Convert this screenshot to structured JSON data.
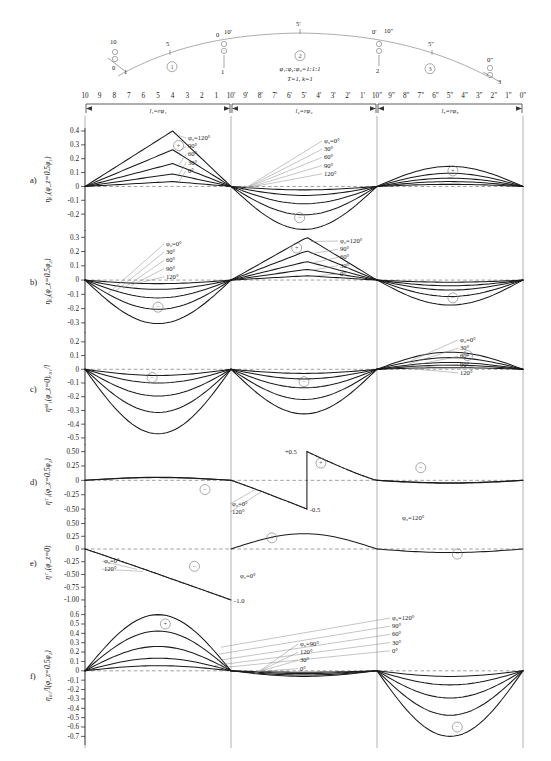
{
  "figure": {
    "title_params": {
      "ratio": "φ₁:φ₂:φ₃=1:1:1",
      "constants": "T=1,  k=1"
    },
    "cam_arc": {
      "sector_labels": [
        "①",
        "②",
        "③"
      ],
      "tick_marks": [
        "5",
        "10",
        "0",
        "10'",
        "5'",
        "0'",
        "10\"",
        "5\"",
        "0\""
      ],
      "node_numbers": [
        "0",
        "1",
        "2",
        "3"
      ]
    },
    "scale_rows": {
      "row1": [
        "10",
        "9",
        "8",
        "7",
        "6",
        "5",
        "4",
        "3",
        "2",
        "1"
      ],
      "row2": [
        "10'",
        "9'",
        "8'",
        "7'",
        "6'",
        "5'",
        "4'",
        "3'",
        "2'",
        "1'"
      ],
      "row3": [
        "10\"",
        "9\"",
        "8\"",
        "7\"",
        "6\"",
        "5\"",
        "4\"",
        "3\"",
        "2\"",
        "1\"",
        "0\""
      ],
      "span_labels": [
        "l₁=rφ₁",
        "l₂=rφ₂",
        "l₃=rφ₃"
      ]
    }
  },
  "panels": [
    {
      "letter": "a)",
      "ylabel": "ηᵦ₁(φ_z=0.5φ₁)",
      "yticks": [
        "0.4",
        "0.3",
        "0.2",
        "0.1",
        "0",
        "-0.1",
        "-0.2"
      ],
      "ymax": 0.4,
      "ymin": -0.3,
      "legend_seg1": [
        "φ₀=120°",
        "90°",
        "60°",
        "30°",
        "0°"
      ],
      "legend_seg2": [
        "φ₀=0°",
        "30°",
        "60°",
        "90°",
        "120°"
      ],
      "signs": [
        {
          "sym": "+",
          "seg": 1
        },
        {
          "sym": "−",
          "seg": 2
        },
        {
          "sym": "+",
          "seg": 3
        }
      ],
      "peaks_seg1": [
        0.4,
        0.265,
        0.165,
        0.09,
        0.035
      ],
      "peaks_seg2": [
        -0.31,
        -0.205,
        -0.125,
        -0.065,
        -0.025
      ],
      "peaks_seg3": [
        0.145,
        0.095,
        0.06,
        0.035,
        0.015
      ]
    },
    {
      "letter": "b)",
      "ylabel": "ηᵦ₂(φ_z=0.5φ₂)",
      "yticks": [
        "0.3",
        "0.2",
        "0.1",
        "0",
        "-0.1",
        "-0.2",
        "-0.3"
      ],
      "ymax": 0.33,
      "ymin": -0.35,
      "legend_seg1": [
        "φ₀=0°",
        "30°",
        "60°",
        "90°",
        "120°"
      ],
      "legend_seg2": [
        "φ₀=120°",
        "90°",
        "60°",
        "30°",
        "0°"
      ],
      "signs": [
        {
          "sym": "−",
          "seg": 1
        },
        {
          "sym": "+",
          "seg": 2
        },
        {
          "sym": "−",
          "seg": 3
        }
      ],
      "peaks_seg1": [
        -0.305,
        -0.205,
        -0.125,
        -0.065,
        -0.025
      ],
      "peaks_seg2": [
        0.3,
        0.205,
        0.13,
        0.075,
        0.03
      ],
      "peaks_seg3": [
        -0.175,
        -0.115,
        -0.07,
        -0.04,
        -0.015
      ]
    },
    {
      "letter": "c)",
      "ylabel": "ηᴹ₁(φ_z=0)ᵣ₀₁/l",
      "yticks": [
        "0.2",
        "0.1",
        "0",
        "-0.1",
        "-0.2",
        "-0.3",
        "-0.4",
        "-0.5"
      ],
      "ymax": 0.25,
      "ymin": -0.53,
      "legend_seg2": [
        "φ₀=0°",
        "30°",
        "60°",
        "90°",
        "120°"
      ],
      "signs": [
        {
          "sym": "−",
          "seg": 1
        },
        {
          "sym": "−",
          "seg": 2
        },
        {
          "sym": "+",
          "seg": 3
        }
      ],
      "peaks_seg1": [
        -0.47,
        -0.315,
        -0.195,
        -0.1,
        -0.045
      ],
      "peaks_seg2": [
        -0.325,
        -0.22,
        -0.135,
        -0.07,
        -0.03
      ],
      "peaks_seg3": [
        0.125,
        0.085,
        0.05,
        0.03,
        0.012
      ]
    },
    {
      "letter": "d)",
      "ylabel": "ηᵀ₁(φ_z=0.5φ₂)",
      "yticks": [
        "0.50",
        "0.25",
        "0",
        "-0.25",
        "-0.50"
      ],
      "ymax": 0.58,
      "ymin": -0.62,
      "legend_seg1": [
        "φ₀=0°",
        "120°"
      ],
      "legend_seg3": [
        "φ₀=120°"
      ],
      "annotations": [
        {
          "text": "+0.5",
          "x": "seg2-start"
        },
        {
          "text": "-0.5",
          "x": "seg2-end"
        }
      ],
      "signs": [
        {
          "sym": "−",
          "seg": 1
        },
        {
          "sym": "+",
          "seg": 2
        },
        {
          "sym": "−",
          "seg": 3
        }
      ]
    },
    {
      "letter": "e)",
      "ylabel": "ηᵀ₁(φ_z=0)",
      "yticks": [
        "0.50",
        "0.25",
        "0",
        "-0.25",
        "-0.50",
        "-0.75",
        "-1.00"
      ],
      "ymax": 0.55,
      "ymin": -1.08,
      "legend_seg1": [
        "φ₀=0°",
        "120°"
      ],
      "legend_seg2": [
        "φ₀=0°"
      ],
      "annotations": [
        {
          "text": "-1.0",
          "x": "seg1-end"
        }
      ],
      "signs": [
        {
          "sym": "−",
          "seg": 1
        },
        {
          "sym": "+",
          "seg": 2
        },
        {
          "sym": "−",
          "seg": 3
        }
      ]
    },
    {
      "letter": "f)",
      "ylabel": "η₀₁/l(φ_z=0.5φ₂)",
      "yticks": [
        "0.6",
        "0.5",
        "0.4",
        "0.3",
        "0.2",
        "0.1",
        "0",
        "-0.1",
        "-0.2",
        "-0.3",
        "-0.4",
        "-0.5",
        "-0.6",
        "-0.7"
      ],
      "ymax": 0.66,
      "ymin": -0.76,
      "legend_seg1": [
        "φ₀=120°",
        "90°",
        "60°",
        "30°",
        "0°"
      ],
      "legend_seg2": [
        "φ₀=90°",
        "120°",
        "30°",
        "0°"
      ],
      "signs": [
        {
          "sym": "+",
          "seg": 1
        },
        {
          "sym": "−",
          "seg": 3
        }
      ],
      "peaks_seg1": [
        0.6,
        0.425,
        0.26,
        0.135,
        0.055
      ],
      "peaks_seg2": [
        -0.06,
        -0.045,
        -0.03,
        -0.015
      ],
      "peaks_seg3": [
        -0.7,
        -0.475,
        -0.29,
        -0.15,
        -0.06
      ]
    }
  ],
  "chart_data": {
    "type": "line",
    "xlabel": "arch ordinate stations (segments l₁, l₂, l₃)",
    "ylabel": "influence coefficient η",
    "parameters": {
      "angle_ratio": "φ₁:φ₂:φ₃ = 1:1:1",
      "T": 1,
      "k": 1,
      "phi0_series_deg": [
        0,
        30,
        60,
        90,
        120
      ]
    },
    "legend": [
      "φ₀=0°",
      "φ₀=30°",
      "φ₀=60°",
      "φ₀=90°",
      "φ₀=120°"
    ],
    "grid": false,
    "legend_position": "inline-leader-lines",
    "subplots": [
      {
        "id": "a",
        "ylabel": "ηᵦ₁(φ_z=0.5φ₁)",
        "ylim": [
          -0.3,
          0.45
        ],
        "series": [
          {
            "name": "φ₀=120°",
            "extrema": {
              "seg1": 0.4,
              "seg2": -0.31,
              "seg3": 0.145
            }
          },
          {
            "name": "φ₀=90°",
            "extrema": {
              "seg1": 0.265,
              "seg2": -0.205,
              "seg3": 0.095
            }
          },
          {
            "name": "φ₀=60°",
            "extrema": {
              "seg1": 0.165,
              "seg2": -0.125,
              "seg3": 0.06
            }
          },
          {
            "name": "φ₀=30°",
            "extrema": {
              "seg1": 0.09,
              "seg2": -0.065,
              "seg3": 0.035
            }
          },
          {
            "name": "φ₀=0°",
            "extrema": {
              "seg1": 0.035,
              "seg2": -0.025,
              "seg3": 0.015
            }
          }
        ]
      },
      {
        "id": "b",
        "ylabel": "ηᵦ₂(φ_z=0.5φ₂)",
        "ylim": [
          -0.35,
          0.35
        ],
        "series": [
          {
            "name": "φ₀=120°",
            "extrema": {
              "seg1": -0.305,
              "seg2": 0.3,
              "seg3": -0.175
            }
          },
          {
            "name": "φ₀=90°",
            "extrema": {
              "seg1": -0.205,
              "seg2": 0.205,
              "seg3": -0.115
            }
          },
          {
            "name": "φ₀=60°",
            "extrema": {
              "seg1": -0.125,
              "seg2": 0.13,
              "seg3": -0.07
            }
          },
          {
            "name": "φ₀=30°",
            "extrema": {
              "seg1": -0.065,
              "seg2": 0.075,
              "seg3": -0.04
            }
          },
          {
            "name": "φ₀=0°",
            "extrema": {
              "seg1": -0.025,
              "seg2": 0.03,
              "seg3": -0.015
            }
          }
        ]
      },
      {
        "id": "c",
        "ylabel": "ηᴹ₁(φ_z=0)ᵣ₀₁/l",
        "ylim": [
          -0.5,
          0.25
        ],
        "series": [
          {
            "name": "φ₀=120°",
            "extrema": {
              "seg1": -0.47,
              "seg2": -0.325,
              "seg3": 0.125
            }
          },
          {
            "name": "φ₀=90°",
            "extrema": {
              "seg1": -0.315,
              "seg2": -0.22,
              "seg3": 0.085
            }
          },
          {
            "name": "φ₀=60°",
            "extrema": {
              "seg1": -0.195,
              "seg2": -0.135,
              "seg3": 0.05
            }
          },
          {
            "name": "φ₀=30°",
            "extrema": {
              "seg1": -0.1,
              "seg2": -0.07,
              "seg3": 0.03
            }
          },
          {
            "name": "φ₀=0°",
            "extrema": {
              "seg1": -0.045,
              "seg2": -0.03,
              "seg3": 0.012
            }
          }
        ]
      },
      {
        "id": "d",
        "ylabel": "ηᵀ₁(φ_z=0.5φ₂)",
        "ylim": [
          -0.5,
          0.5
        ],
        "note": "sawtooth discontinuity in segment 2: jumps from -0.5 to +0.5",
        "series": [
          {
            "name": "φ₀=0°",
            "extrema": {
              "seg2_jump_low": -0.5,
              "seg2_jump_high": 0.5
            }
          },
          {
            "name": "φ₀=120°",
            "extrema": {
              "seg2_jump_low": -0.5,
              "seg2_jump_high": 0.5
            }
          }
        ]
      },
      {
        "id": "e",
        "ylabel": "ηᵀ₁(φ_z=0)",
        "ylim": [
          -1.0,
          0.5
        ],
        "series": [
          {
            "name": "φ₀=0°",
            "extrema": {
              "seg1_end": -1.0
            }
          },
          {
            "name": "φ₀=120°",
            "extrema": {
              "seg1_end": -1.0
            }
          }
        ]
      },
      {
        "id": "f",
        "ylabel": "η₀₁/l(φ_z=0.5φ₂)",
        "ylim": [
          -0.7,
          0.6
        ],
        "series": [
          {
            "name": "φ₀=120°",
            "extrema": {
              "seg1": 0.6,
              "seg3": -0.7
            }
          },
          {
            "name": "φ₀=90°",
            "extrema": {
              "seg1": 0.425,
              "seg3": -0.475
            }
          },
          {
            "name": "φ₀=60°",
            "extrema": {
              "seg1": 0.26,
              "seg3": -0.29
            }
          },
          {
            "name": "φ₀=30°",
            "extrema": {
              "seg1": 0.135,
              "seg3": -0.15
            }
          },
          {
            "name": "φ₀=0°",
            "extrema": {
              "seg1": 0.055,
              "seg3": -0.06
            }
          }
        ]
      }
    ]
  }
}
